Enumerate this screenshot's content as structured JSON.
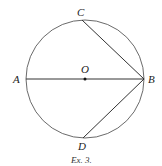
{
  "figure": {
    "caption": "Ex. 3.",
    "points": {
      "A": "A",
      "B": "B",
      "C": "C",
      "D": "D",
      "O": "O"
    },
    "elements": [
      "circle with center O",
      "diameter AB",
      "chord BC",
      "chord BD"
    ]
  }
}
